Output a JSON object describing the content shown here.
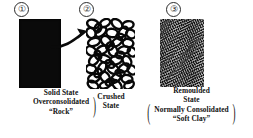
{
  "figure": {
    "background_color": "#ffffff",
    "ink_color": "#111111"
  },
  "steps": [
    {
      "number": "①",
      "id": "solid-state",
      "texture": "solid-black-slab",
      "caption": {
        "heading": "Solid State",
        "paren_lines": [
          "Overconsolidated",
          "“Rock”"
        ],
        "paren_left": "",
        "paren_right": ")"
      }
    },
    {
      "number": "②",
      "id": "crushed-state",
      "texture": "crushed-rings",
      "caption": {
        "heading_lines": [
          "Crushed",
          "State"
        ],
        "paren_lines": [],
        "paren_left": "",
        "paren_right": ""
      }
    },
    {
      "number": "③",
      "id": "remoulded-state",
      "texture": "fine-grey-speckle",
      "caption": {
        "heading_lines": [
          "Remoulded",
          "State"
        ],
        "paren_lines": [
          "Normally Consolidated",
          "“Soft Clay”"
        ],
        "paren_left": "(",
        "paren_right": ")"
      }
    }
  ],
  "arrow": {
    "name": "crushing-arrow",
    "from": "solid-state",
    "to": "crushed-state",
    "color": "#0a0a0a"
  }
}
